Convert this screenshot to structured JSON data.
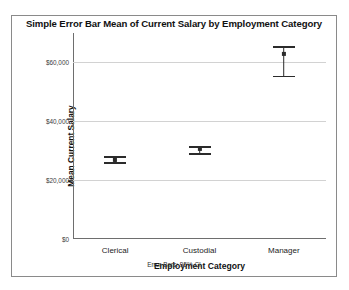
{
  "chart_data": {
    "type": "scatter",
    "title": "Simple Error Bar Mean of Current Salary by Employment Category",
    "xlabel": "Employment Category",
    "ylabel": "Mean Current Salary",
    "footnote": "Error Bars: 95% CI",
    "categories": [
      "Clerical",
      "Custodial",
      "Manager"
    ],
    "values": [
      27000,
      30500,
      63000
    ],
    "error_low": [
      26000,
      29300,
      55500
    ],
    "error_high": [
      28100,
      31700,
      65500
    ],
    "ylim": [
      0,
      70000
    ],
    "yticks": [
      0,
      20000,
      40000,
      60000
    ],
    "ytick_labels": [
      "$0",
      "$20,000",
      "$40,000",
      "$60,000"
    ],
    "grid": true,
    "legend": "none",
    "series_name": "Mean Current Salary",
    "error_type": "95% CI",
    "marker_color": "#2b2b2b",
    "gridline_color": "#d2d2d2",
    "axis_color": "#6e6e6e",
    "background_color": "#ffffff"
  }
}
